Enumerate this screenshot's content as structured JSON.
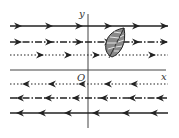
{
  "figure": {
    "type": "wind-field-diagram",
    "axes": {
      "x_label": "x",
      "y_label": "y",
      "origin_label": "O"
    },
    "rows": [
      {
        "y": 26,
        "direction": "right",
        "style": "solid",
        "arrows_x": [
          22,
          53,
          83,
          112,
          140,
          168
        ]
      },
      {
        "y": 42,
        "direction": "right",
        "style": "dash-dot",
        "arrows_x": [
          22,
          53,
          83,
          112,
          140,
          168
        ]
      },
      {
        "y": 55,
        "direction": "right",
        "style": "dotted",
        "arrows_x": [
          44,
          72,
          100,
          156
        ]
      },
      {
        "y": 84,
        "direction": "left",
        "style": "dotted",
        "arrows_x": [
          22,
          48,
          78,
          104,
          130
        ]
      },
      {
        "y": 98,
        "direction": "left",
        "style": "dash-dot",
        "arrows_x": [
          16,
          44,
          72,
          100,
          128,
          156
        ]
      },
      {
        "y": 113,
        "direction": "left",
        "style": "solid",
        "arrows_x": [
          16,
          38,
          64,
          92,
          122,
          150
        ]
      }
    ],
    "leaf": {
      "cx": 116,
      "cy": 42,
      "fill": "#7a7a7a"
    },
    "line_color": "#222222"
  }
}
